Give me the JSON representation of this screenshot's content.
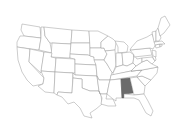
{
  "map": {
    "title": "United States",
    "highlighted_state": "Alabama",
    "colors": {
      "highlight": "#6b6b6b",
      "default_fill": "#ffffff",
      "border": "#9a9a9a"
    },
    "states": [
      {
        "name": "Washington"
      },
      {
        "name": "Oregon"
      },
      {
        "name": "California"
      },
      {
        "name": "Nevada"
      },
      {
        "name": "Idaho"
      },
      {
        "name": "Montana"
      },
      {
        "name": "Wyoming"
      },
      {
        "name": "Utah"
      },
      {
        "name": "Arizona"
      },
      {
        "name": "Colorado"
      },
      {
        "name": "New Mexico"
      },
      {
        "name": "North Dakota"
      },
      {
        "name": "South Dakota"
      },
      {
        "name": "Nebraska"
      },
      {
        "name": "Kansas"
      },
      {
        "name": "Oklahoma"
      },
      {
        "name": "Texas"
      },
      {
        "name": "Minnesota"
      },
      {
        "name": "Iowa"
      },
      {
        "name": "Missouri"
      },
      {
        "name": "Arkansas"
      },
      {
        "name": "Louisiana"
      },
      {
        "name": "Wisconsin"
      },
      {
        "name": "Illinois"
      },
      {
        "name": "Michigan"
      },
      {
        "name": "Indiana"
      },
      {
        "name": "Ohio"
      },
      {
        "name": "Kentucky"
      },
      {
        "name": "Tennessee"
      },
      {
        "name": "Mississippi"
      },
      {
        "name": "Alabama",
        "highlighted": true
      },
      {
        "name": "Georgia"
      },
      {
        "name": "Florida"
      },
      {
        "name": "South Carolina"
      },
      {
        "name": "North Carolina"
      },
      {
        "name": "Virginia"
      },
      {
        "name": "West Virginia"
      },
      {
        "name": "Pennsylvania"
      },
      {
        "name": "New York"
      },
      {
        "name": "Maryland"
      },
      {
        "name": "Delaware"
      },
      {
        "name": "New Jersey"
      },
      {
        "name": "Connecticut"
      },
      {
        "name": "Rhode Island"
      },
      {
        "name": "Massachusetts"
      },
      {
        "name": "Vermont"
      },
      {
        "name": "New Hampshire"
      },
      {
        "name": "Maine"
      }
    ]
  }
}
